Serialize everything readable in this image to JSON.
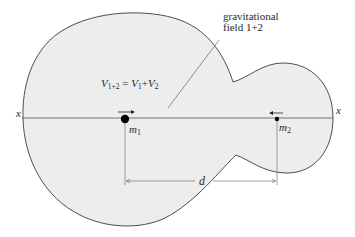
{
  "diagram": {
    "field_label_line1": "gravitational",
    "field_label_line2": "field 1+2",
    "potential_formula": {
      "lhs_symbol": "V",
      "lhs_subscript": "1+2",
      "equals": " = ",
      "term1_symbol": "V",
      "term1_subscript": "1",
      "plus": "+",
      "term2_symbol": "V",
      "term2_subscript": "2"
    },
    "axis_label_left": "x",
    "axis_label_right": "x",
    "mass1": {
      "symbol": "m",
      "subscript": "1"
    },
    "mass2": {
      "symbol": "m",
      "subscript": "2"
    },
    "distance_label": "d",
    "colors": {
      "field_fill": "#ededed",
      "outline": "#3a3a3a",
      "axis": "#555555",
      "mass": "#000000"
    }
  }
}
